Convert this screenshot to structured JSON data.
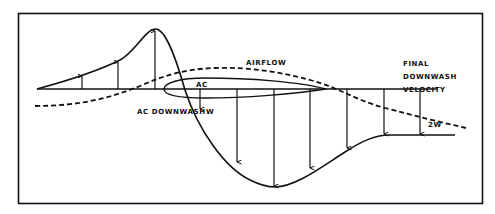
{
  "figure": {
    "colors": {
      "ink": "#111111",
      "background": "#ffffff"
    }
  },
  "labels": {
    "airflow": "AIRFLOW",
    "ac": "AC",
    "ac_downwash": "AC DOWNWASH",
    "w": "W",
    "final_line1": "FINAL",
    "final_line2": "DOWNWASH",
    "final_line3": "VELOCITY",
    "two_w": "2W"
  },
  "elements": {
    "baseline": "Free-stream reference line",
    "airfoil": "Airfoil section",
    "airflow_line": "Dashed airflow streamline",
    "velocity_curve": "Upwash/downwash velocity curve",
    "upwash_arrows": 3,
    "downwash_arrows": 7
  }
}
